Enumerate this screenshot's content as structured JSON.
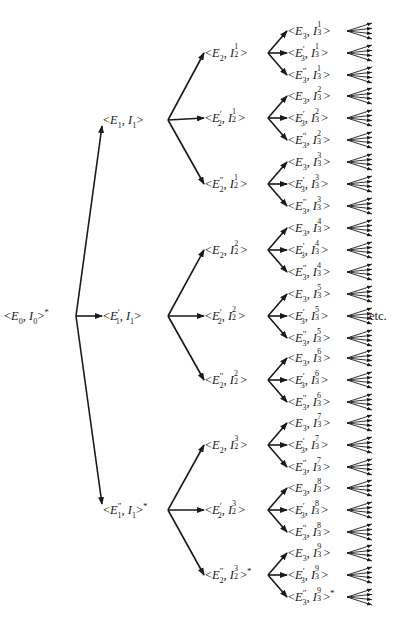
{
  "diagram": {
    "type": "tree",
    "direction": "left-to-right",
    "root": {
      "label": "<E0, I0>*",
      "E": "E",
      "E_sub": "0",
      "E_prime": "",
      "I": "I",
      "I_sub": "0",
      "I_sup": "",
      "star": true
    },
    "level1": [
      {
        "E_prime": "",
        "E_sub": "1",
        "I_sub": "1",
        "I_sup": "",
        "star": false
      },
      {
        "E_prime": "′",
        "E_sub": "1",
        "I_sub": "1",
        "I_sup": "",
        "star": false
      },
      {
        "E_prime": "″",
        "E_sub": "1",
        "I_sub": "1",
        "I_sup": "",
        "star": true
      }
    ],
    "level2": [
      {
        "E_prime": "",
        "E_sub": "2",
        "I_sub": "2",
        "I_sup": "1",
        "star": false
      },
      {
        "E_prime": "′",
        "E_sub": "2",
        "I_sub": "2",
        "I_sup": "1",
        "star": false
      },
      {
        "E_prime": "″",
        "E_sub": "2",
        "I_sub": "2",
        "I_sup": "1",
        "star": false
      },
      {
        "E_prime": "",
        "E_sub": "2",
        "I_sub": "2",
        "I_sup": "2",
        "star": false
      },
      {
        "E_prime": "′",
        "E_sub": "2",
        "I_sub": "2",
        "I_sup": "2",
        "star": false
      },
      {
        "E_prime": "″",
        "E_sub": "2",
        "I_sub": "2",
        "I_sup": "2",
        "star": false
      },
      {
        "E_prime": "",
        "E_sub": "2",
        "I_sub": "2",
        "I_sup": "3",
        "star": false
      },
      {
        "E_prime": "′",
        "E_sub": "2",
        "I_sub": "2",
        "I_sup": "3",
        "star": false
      },
      {
        "E_prime": "″",
        "E_sub": "2",
        "I_sub": "2",
        "I_sup": "3",
        "star": true
      }
    ],
    "level3_I_superscripts": [
      "1",
      "2",
      "3",
      "4",
      "5",
      "6",
      "7",
      "8",
      "9"
    ],
    "level3_E_primes": [
      "",
      "′",
      "″"
    ],
    "level3_star_leaf": {
      "group": 9,
      "E_prime": "″"
    },
    "leaf_fan_arrows": 4,
    "continuation_label": "etc.",
    "line_color": "#1a1a1a"
  }
}
